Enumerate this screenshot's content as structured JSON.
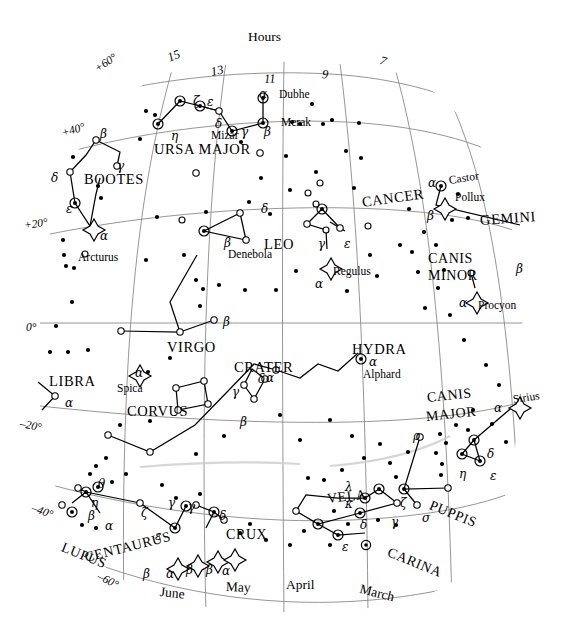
{
  "chart_data": {
    "type": "scatter",
    "xlabel": "Hours",
    "ylabel": "Declination",
    "grid": true,
    "legend": false,
    "projection": "curved equatorial band",
    "xlim": [
      16,
      6
    ],
    "ylim": [
      -65,
      65
    ],
    "axis_top_label": "Hours",
    "hour_ticks": [
      "15",
      "13",
      "11",
      "9",
      "7"
    ],
    "declination_ticks": [
      "+60°",
      "+40°",
      "+20°",
      "0°",
      "–20°",
      "–40°",
      "–60°"
    ],
    "month_ticks": [
      "June",
      "May",
      "April",
      "March"
    ],
    "constellations": [
      {
        "name": "URSA MAJOR",
        "stars": [
          "α Dubhe",
          "β Merak",
          "γ",
          "δ",
          "ε",
          "ζ Mizar",
          "η"
        ]
      },
      {
        "name": "BOOTES",
        "stars": [
          "α Arcturus",
          "β",
          "γ",
          "δ",
          "ε"
        ]
      },
      {
        "name": "LEO",
        "stars": [
          "α Regulus",
          "β Denebola",
          "γ",
          "δ",
          "ε"
        ]
      },
      {
        "name": "CANCER",
        "stars": []
      },
      {
        "name": "GEMINI",
        "stars": [
          "α Castor",
          "Pollux",
          "β"
        ]
      },
      {
        "name": "CANIS MINOR",
        "stars": [
          "α Procyon",
          "β"
        ]
      },
      {
        "name": "VIRGO",
        "stars": [
          "α Spica",
          "β"
        ]
      },
      {
        "name": "LIBRA",
        "stars": [
          "α"
        ]
      },
      {
        "name": "CRATER",
        "stars": [
          "α",
          "β",
          "γ",
          "δ"
        ]
      },
      {
        "name": "CORVUS",
        "stars": []
      },
      {
        "name": "HYDRA",
        "stars": [
          "α Alphard"
        ]
      },
      {
        "name": "CANIS MAJOR",
        "stars": [
          "α Sirius",
          "δ",
          "ε",
          "η"
        ]
      },
      {
        "name": "PUPPIS",
        "stars": [
          "ζ",
          "ρ",
          "σ"
        ]
      },
      {
        "name": "VELA",
        "stars": [
          "γ",
          "δ",
          "κ",
          "λ"
        ]
      },
      {
        "name": "CARINA",
        "stars": [
          "ε"
        ]
      },
      {
        "name": "CRUX",
        "stars": [
          "α",
          "β",
          "γ",
          "δ"
        ]
      },
      {
        "name": "CENTAURUS",
        "stars": [
          "α",
          "β",
          "γ",
          "ε",
          "ζ",
          "η",
          "θ"
        ]
      },
      {
        "name": "LUPUS",
        "stars": [
          "α",
          "β"
        ]
      }
    ]
  },
  "header": {
    "hours_label": "Hours"
  },
  "hours": [
    {
      "text": "15",
      "x": 168,
      "y": 52,
      "rot": -22
    },
    {
      "text": "13",
      "x": 211,
      "y": 66,
      "rot": -12
    },
    {
      "text": "11",
      "x": 264,
      "y": 73,
      "rot": -3
    },
    {
      "text": "9",
      "x": 322,
      "y": 68,
      "rot": 7
    },
    {
      "text": "7",
      "x": 380,
      "y": 54,
      "rot": 17
    }
  ],
  "declinations": [
    {
      "text": "+60°",
      "x": 96,
      "y": 64,
      "rot": -34
    },
    {
      "text": "+40°",
      "x": 62,
      "y": 128,
      "rot": -17
    },
    {
      "text": "+20°",
      "x": 24,
      "y": 220,
      "rot": -8
    },
    {
      "text": "0°",
      "x": 26,
      "y": 322,
      "rot": 0
    },
    {
      "text": "–20°",
      "x": 20,
      "y": 418,
      "rot": 11
    },
    {
      "text": "–40°",
      "x": 32,
      "y": 502,
      "rot": 20
    },
    {
      "text": "–60°",
      "x": 98,
      "y": 570,
      "rot": 27
    }
  ],
  "months": [
    {
      "text": "June",
      "x": 160,
      "y": 585,
      "rot": 6
    },
    {
      "text": "May",
      "x": 226,
      "y": 580,
      "rot": 2
    },
    {
      "text": "April",
      "x": 286,
      "y": 578,
      "rot": 0
    },
    {
      "text": "March",
      "x": 360,
      "y": 582,
      "rot": 14
    }
  ],
  "constellation_labels": [
    {
      "text": "URSA MAJOR",
      "x": 154,
      "y": 142,
      "rot": 0,
      "size": 14.5
    },
    {
      "text": "BOOTES",
      "x": 84,
      "y": 172,
      "rot": 0,
      "size": 14.5
    },
    {
      "text": "LEO",
      "x": 264,
      "y": 237,
      "rot": 0,
      "size": 14.5
    },
    {
      "text": "CANCER",
      "x": 362,
      "y": 195,
      "rot": -8,
      "size": 14.5
    },
    {
      "text": "GEMINI",
      "x": 480,
      "y": 213,
      "rot": -4,
      "size": 14.5
    },
    {
      "text": "CANIS",
      "x": 428,
      "y": 252,
      "rot": 0,
      "size": 14
    },
    {
      "text": "MINOR",
      "x": 428,
      "y": 269,
      "rot": 0,
      "size": 14
    },
    {
      "text": "VIRGO",
      "x": 167,
      "y": 340,
      "rot": 0,
      "size": 14.5
    },
    {
      "text": "LIBRA",
      "x": 49,
      "y": 374,
      "rot": 0,
      "size": 14.5
    },
    {
      "text": "CRATER",
      "x": 234,
      "y": 360,
      "rot": 0,
      "size": 14.5
    },
    {
      "text": "CORVUS",
      "x": 127,
      "y": 404,
      "rot": 0,
      "size": 14.5
    },
    {
      "text": "HYDRA",
      "x": 352,
      "y": 342,
      "rot": 0,
      "size": 14.5
    },
    {
      "text": "CANIS",
      "x": 427,
      "y": 391,
      "rot": -6,
      "size": 14
    },
    {
      "text": "MAJOR",
      "x": 426,
      "y": 410,
      "rot": -6,
      "size": 14
    },
    {
      "text": "PUPPIS",
      "x": 430,
      "y": 498,
      "rot": 22,
      "size": 14
    },
    {
      "text": "VELA",
      "x": 327,
      "y": 492,
      "rot": -6,
      "size": 14
    },
    {
      "text": "CARINA",
      "x": 388,
      "y": 545,
      "rot": 22,
      "size": 14
    },
    {
      "text": "CRUX",
      "x": 226,
      "y": 528,
      "rot": 0,
      "size": 14
    },
    {
      "text": "CENTAURUS",
      "x": 85,
      "y": 551,
      "rot": -14,
      "size": 14
    },
    {
      "text": "LUPUS",
      "x": 62,
      "y": 540,
      "rot": 22,
      "size": 14
    }
  ],
  "star_names": [
    {
      "text": "Dubhe",
      "x": 279,
      "y": 89,
      "rot": 0
    },
    {
      "text": "Merak",
      "x": 281,
      "y": 117,
      "rot": 0
    },
    {
      "text": "Mizar",
      "x": 211,
      "y": 130,
      "rot": 0
    },
    {
      "text": "Arcturus",
      "x": 78,
      "y": 252,
      "rot": 0
    },
    {
      "text": "Denebola",
      "x": 228,
      "y": 249,
      "rot": 0
    },
    {
      "text": "Regulus",
      "x": 333,
      "y": 266,
      "rot": 0
    },
    {
      "text": "Castor",
      "x": 449,
      "y": 175,
      "rot": -9
    },
    {
      "text": "Pollux",
      "x": 455,
      "y": 192,
      "rot": 0
    },
    {
      "text": "Procyon",
      "x": 478,
      "y": 300,
      "rot": 0
    },
    {
      "text": "Spica",
      "x": 117,
      "y": 383,
      "rot": 0
    },
    {
      "text": "Alphard",
      "x": 363,
      "y": 369,
      "rot": 0
    },
    {
      "text": "Sirius",
      "x": 513,
      "y": 394,
      "rot": -8
    }
  ],
  "greek_labels": [
    {
      "text": "α",
      "x": 259,
      "y": 88
    },
    {
      "text": "β",
      "x": 264,
      "y": 126
    },
    {
      "text": "γ",
      "x": 241,
      "y": 126
    },
    {
      "text": "δ",
      "x": 215,
      "y": 118
    },
    {
      "text": "ε",
      "x": 207,
      "y": 96
    },
    {
      "text": "ζ",
      "x": 193,
      "y": 95
    },
    {
      "text": "η",
      "x": 171,
      "y": 130
    },
    {
      "text": "β",
      "x": 100,
      "y": 128
    },
    {
      "text": "γ",
      "x": 117,
      "y": 160
    },
    {
      "text": "δ",
      "x": 51,
      "y": 172
    },
    {
      "text": "ε",
      "x": 66,
      "y": 203
    },
    {
      "text": "α",
      "x": 100,
      "y": 230
    },
    {
      "text": "α",
      "x": 428,
      "y": 177
    },
    {
      "text": "β",
      "x": 427,
      "y": 210
    },
    {
      "text": "β",
      "x": 516,
      "y": 263
    },
    {
      "text": "α",
      "x": 459,
      "y": 297
    },
    {
      "text": "δ",
      "x": 261,
      "y": 203
    },
    {
      "text": "β",
      "x": 224,
      "y": 237
    },
    {
      "text": "γ",
      "x": 318,
      "y": 238
    },
    {
      "text": "ε",
      "x": 344,
      "y": 238
    },
    {
      "text": "α",
      "x": 315,
      "y": 278
    },
    {
      "text": "β",
      "x": 223,
      "y": 316
    },
    {
      "text": "α",
      "x": 65,
      "y": 397
    },
    {
      "text": "α",
      "x": 135,
      "y": 367
    },
    {
      "text": "α",
      "x": 266,
      "y": 372
    },
    {
      "text": "β",
      "x": 240,
      "y": 416
    },
    {
      "text": "γ",
      "x": 232,
      "y": 386
    },
    {
      "text": "δ",
      "x": 258,
      "y": 373
    },
    {
      "text": "α",
      "x": 369,
      "y": 356
    },
    {
      "text": "α",
      "x": 494,
      "y": 402
    },
    {
      "text": "δ",
      "x": 487,
      "y": 448
    },
    {
      "text": "ε",
      "x": 490,
      "y": 470
    },
    {
      "text": "η",
      "x": 459,
      "y": 468
    },
    {
      "text": "ρ",
      "x": 413,
      "y": 430
    },
    {
      "text": "ζ",
      "x": 400,
      "y": 497
    },
    {
      "text": "σ",
      "x": 422,
      "y": 512
    },
    {
      "text": "λ",
      "x": 345,
      "y": 481
    },
    {
      "text": "κ",
      "x": 345,
      "y": 498
    },
    {
      "text": "δ",
      "x": 360,
      "y": 519
    },
    {
      "text": "γ",
      "x": 391,
      "y": 516
    },
    {
      "text": "ε",
      "x": 342,
      "y": 541
    },
    {
      "text": "γ",
      "x": 188,
      "y": 501
    },
    {
      "text": "δ",
      "x": 219,
      "y": 510
    },
    {
      "text": "α",
      "x": 222,
      "y": 565
    },
    {
      "text": "β",
      "x": 206,
      "y": 564
    },
    {
      "text": "β",
      "x": 186,
      "y": 564
    },
    {
      "text": "α",
      "x": 166,
      "y": 568
    },
    {
      "text": "β",
      "x": 143,
      "y": 568
    },
    {
      "text": "θ",
      "x": 98,
      "y": 478
    },
    {
      "text": "η",
      "x": 91,
      "y": 497
    },
    {
      "text": "β",
      "x": 88,
      "y": 510
    },
    {
      "text": "α",
      "x": 105,
      "y": 520
    },
    {
      "text": "ζ",
      "x": 141,
      "y": 507
    },
    {
      "text": "ε",
      "x": 155,
      "y": 530
    },
    {
      "text": "γ",
      "x": 168,
      "y": 497
    }
  ]
}
